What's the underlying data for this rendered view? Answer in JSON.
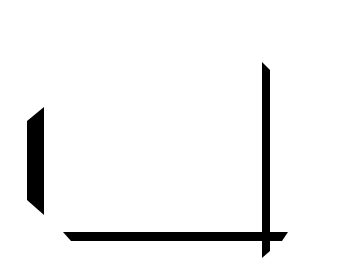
{
  "figure": {
    "background_color": "#ffffff",
    "stroke_color": "#000000",
    "shapes": [
      {
        "name": "left-bar",
        "points": "27,121 44,107 44,215 27,200"
      },
      {
        "name": "right-vertical-bar",
        "points": "262,62 270,70 270,251 262,258"
      },
      {
        "name": "bottom-horizontal-bar",
        "points": "63,232 288,232 282,241 71,241"
      }
    ]
  }
}
